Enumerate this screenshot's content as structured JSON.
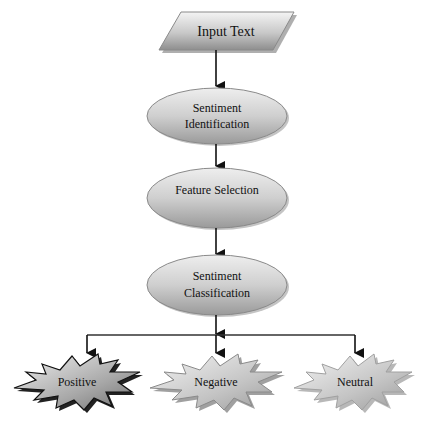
{
  "flowchart": {
    "input": {
      "label": "Input Text",
      "shape": "parallelogram"
    },
    "steps": [
      {
        "line1": "Sentiment",
        "line2": "Identification",
        "shape": "ellipse"
      },
      {
        "line1": "Feature Selection",
        "line2": "",
        "shape": "ellipse"
      },
      {
        "line1": "Sentiment",
        "line2": "Classification",
        "shape": "ellipse"
      }
    ],
    "outputs": [
      {
        "label": "Positive",
        "shape": "explosion"
      },
      {
        "label": "Negative",
        "shape": "explosion"
      },
      {
        "label": "Neutral",
        "shape": "explosion"
      }
    ]
  },
  "colors": {
    "shape_light": "#f2f2f2",
    "shape_dark": "#8c8c8c",
    "outline": "#555555",
    "connector": "#111111",
    "text": "#111111"
  }
}
